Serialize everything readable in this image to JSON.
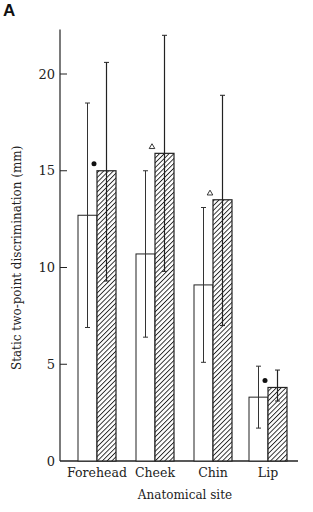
{
  "panel_label": "A",
  "chart_data": {
    "type": "bar",
    "title": "",
    "xlabel": "Anatomical site",
    "ylabel": "Static two-point discrimination (mm)",
    "ylim": [
      0,
      22.3
    ],
    "yticks": [
      0,
      5,
      10,
      15,
      20
    ],
    "grid": false,
    "legend": null,
    "categories": [
      "Forehead",
      "Cheek",
      "Chin",
      "Lip"
    ],
    "series": [
      {
        "name": "open",
        "style": "open",
        "values": [
          12.7,
          10.7,
          9.1,
          3.3
        ],
        "error_low": [
          6.9,
          6.4,
          5.1,
          1.7
        ],
        "error_high": [
          18.5,
          15.0,
          13.1,
          4.9
        ]
      },
      {
        "name": "hatched",
        "style": "hatched",
        "values": [
          15.0,
          15.9,
          13.5,
          3.8
        ],
        "error_low": [
          9.3,
          9.8,
          7.0,
          3.1
        ],
        "error_high": [
          20.6,
          22.0,
          18.9,
          4.7
        ],
        "markers": [
          "dot",
          "triangle",
          "triangle",
          "dot"
        ]
      }
    ],
    "annotations": [
      {
        "category": "Forehead",
        "symbol": "●"
      },
      {
        "category": "Cheek",
        "symbol": "△"
      },
      {
        "category": "Chin",
        "symbol": "△"
      },
      {
        "category": "Lip",
        "symbol": "●"
      }
    ]
  }
}
